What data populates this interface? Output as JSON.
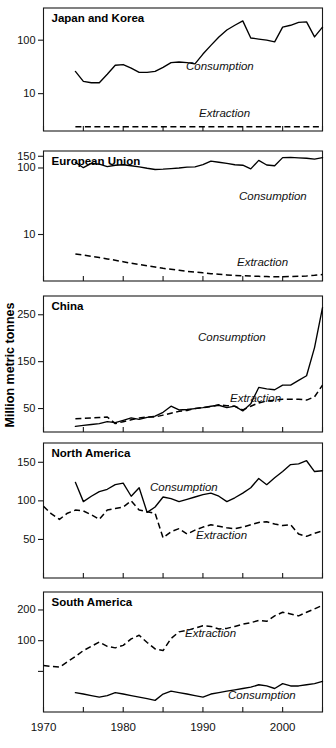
{
  "figure": {
    "ylabel": "Million metric tonnes",
    "xlabel": "",
    "xticks": [
      "1970",
      "1980",
      "1990",
      "2000"
    ],
    "xminor_step_years": 5,
    "xlim": [
      1970,
      2005
    ],
    "grid": false,
    "legend_position": "inline-annotation",
    "line_colors": {
      "consumption": "#000000",
      "extraction": "#000000"
    },
    "consumption_label": "Consumption",
    "extraction_label": "Extraction"
  },
  "chart_data": [
    {
      "type": "line",
      "title": "Japan and Korea",
      "xlabel": "",
      "ylabel": "Million metric tonnes",
      "yscale": "log",
      "ylim": [
        2,
        400
      ],
      "yticks": [
        10,
        100
      ],
      "ytick_labels": [
        "10",
        "100"
      ],
      "x": [
        1974,
        1975,
        1976,
        1977,
        1978,
        1979,
        1980,
        1981,
        1982,
        1983,
        1984,
        1985,
        1986,
        1987,
        1988,
        1989,
        1990,
        1991,
        1992,
        1993,
        1994,
        1995,
        1996,
        1997,
        1998,
        1999,
        2000,
        2001,
        2002,
        2003,
        2004,
        2005
      ],
      "series": [
        {
          "name": "Consumption",
          "style": "solid",
          "values": [
            26,
            17,
            16,
            16,
            23,
            34,
            35,
            30,
            25,
            25,
            26,
            31,
            38,
            39,
            38,
            36,
            55,
            80,
            115,
            155,
            190,
            230,
            110,
            105,
            100,
            93,
            175,
            190,
            215,
            220,
            115,
            175
          ]
        },
        {
          "name": "Extraction",
          "style": "dashed",
          "values": [
            2.4,
            2.4,
            2.4,
            2.4,
            2.4,
            2.4,
            2.4,
            2.4,
            2.4,
            2.4,
            2.4,
            2.4,
            2.4,
            2.4,
            2.4,
            2.4,
            2.4,
            2.4,
            2.4,
            2.4,
            2.4,
            2.4,
            2.4,
            2.4,
            2.4,
            2.4,
            2.4,
            2.4,
            2.4,
            2.4,
            2.4,
            2.4
          ]
        }
      ]
    },
    {
      "type": "line",
      "title": "European Union",
      "xlabel": "",
      "ylabel": "Million metric tonnes",
      "yscale": "log",
      "ylim": [
        2,
        180
      ],
      "yticks": [
        10,
        100,
        150
      ],
      "ytick_labels": [
        "10",
        "100",
        "150"
      ],
      "x": [
        1974,
        1975,
        1976,
        1977,
        1978,
        1979,
        1980,
        1981,
        1982,
        1983,
        1984,
        1985,
        1986,
        1987,
        1988,
        1989,
        1990,
        1991,
        1992,
        1993,
        1994,
        1995,
        1996,
        1997,
        1998,
        1999,
        2000,
        2001,
        2002,
        2003,
        2004,
        2005
      ],
      "series": [
        {
          "name": "Consumption",
          "style": "solid",
          "values": [
            122,
            101,
            117,
            114,
            105,
            110,
            112,
            108,
            104,
            99,
            95,
            96,
            98,
            100,
            103,
            104,
            112,
            127,
            122,
            117,
            112,
            110,
            97,
            130,
            111,
            108,
            143,
            144,
            142,
            140,
            136,
            143
          ]
        },
        {
          "name": "Extraction",
          "style": "dashed",
          "values": [
            5.1,
            4.9,
            4.7,
            4.5,
            4.3,
            4.1,
            3.9,
            3.7,
            3.55,
            3.4,
            3.25,
            3.1,
            3.0,
            2.9,
            2.8,
            2.72,
            2.65,
            2.58,
            2.52,
            2.47,
            2.43,
            2.4,
            2.37,
            2.35,
            2.33,
            2.32,
            2.32,
            2.33,
            2.35,
            2.38,
            2.43,
            2.5
          ]
        }
      ]
    },
    {
      "type": "line",
      "title": "China",
      "xlabel": "",
      "ylabel": "Million metric tonnes",
      "yscale": "linear",
      "ylim": [
        0,
        290
      ],
      "yticks": [
        50,
        150,
        250
      ],
      "ytick_labels": [
        "50",
        "150",
        "250"
      ],
      "x": [
        1974,
        1975,
        1976,
        1977,
        1978,
        1979,
        1980,
        1981,
        1982,
        1983,
        1984,
        1985,
        1986,
        1987,
        1988,
        1989,
        1990,
        1991,
        1992,
        1993,
        1994,
        1995,
        1996,
        1997,
        1998,
        1999,
        2000,
        2001,
        2002,
        2003,
        2004,
        2005
      ],
      "series": [
        {
          "name": "Consumption",
          "style": "solid",
          "values": [
            12,
            14,
            16,
            18,
            22,
            20,
            25,
            30,
            27,
            31,
            34,
            42,
            55,
            47,
            48,
            50,
            52,
            55,
            57,
            52,
            55,
            45,
            60,
            95,
            92,
            90,
            100,
            100,
            110,
            120,
            180,
            265
          ]
        },
        {
          "name": "Extraction",
          "style": "dashed",
          "values": [
            28,
            29,
            30,
            31,
            32,
            18,
            22,
            26,
            30,
            32,
            32,
            36,
            40,
            44,
            46,
            50,
            52,
            54,
            58,
            56,
            55,
            47,
            55,
            62,
            66,
            68,
            70,
            70,
            70,
            68,
            75,
            100
          ]
        }
      ]
    },
    {
      "type": "line",
      "title": "North America",
      "xlabel": "",
      "ylabel": "Million metric tonnes",
      "yscale": "linear",
      "ylim": [
        0,
        175
      ],
      "yticks": [
        50,
        100,
        150
      ],
      "ytick_labels": [
        "50",
        "100",
        "150"
      ],
      "x": [
        1970,
        1971,
        1972,
        1973,
        1974,
        1975,
        1976,
        1977,
        1978,
        1979,
        1980,
        1981,
        1982,
        1983,
        1984,
        1985,
        1986,
        1987,
        1988,
        1989,
        1990,
        1991,
        1992,
        1993,
        1994,
        1995,
        1996,
        1997,
        1998,
        1999,
        2000,
        2001,
        2002,
        2003,
        2004,
        2005
      ],
      "series": [
        {
          "name": "Consumption",
          "style": "solid",
          "values": [
            null,
            null,
            null,
            null,
            124,
            99,
            106,
            112,
            115,
            121,
            123,
            106,
            117,
            85,
            92,
            105,
            103,
            99,
            102,
            105,
            108,
            110,
            106,
            99,
            104,
            110,
            117,
            129,
            121,
            130,
            138,
            147,
            148,
            152,
            138,
            139
          ]
        },
        {
          "name": "Extraction",
          "style": "dashed",
          "values": [
            93,
            83,
            76,
            84,
            88,
            87,
            82,
            76,
            88,
            90,
            92,
            100,
            88,
            86,
            84,
            52,
            60,
            64,
            57,
            62,
            66,
            69,
            67,
            65,
            64,
            66,
            69,
            72,
            73,
            70,
            68,
            69,
            57,
            54,
            58,
            61
          ]
        }
      ]
    },
    {
      "type": "line",
      "title": "South America",
      "xlabel": "",
      "ylabel": "Million metric tonnes",
      "yscale": "log",
      "ylim": [
        20,
        300
      ],
      "yticks": [
        50,
        100,
        200
      ],
      "ytick_labels": [
        "",
        "100",
        "200"
      ],
      "x": [
        1970,
        1971,
        1972,
        1973,
        1974,
        1975,
        1976,
        1977,
        1978,
        1979,
        1980,
        1981,
        1982,
        1983,
        1984,
        1985,
        1986,
        1987,
        1988,
        1989,
        1990,
        1991,
        1992,
        1993,
        1994,
        1995,
        1996,
        1997,
        1998,
        1999,
        2000,
        2001,
        2002,
        2003,
        2004,
        2005
      ],
      "series": [
        {
          "name": "Extraction",
          "style": "dashed",
          "values": [
            57,
            56,
            55,
            62,
            70,
            80,
            88,
            97,
            88,
            85,
            90,
            104,
            113,
            96,
            83,
            80,
            105,
            122,
            126,
            133,
            140,
            138,
            130,
            132,
            138,
            145,
            150,
            158,
            155,
            175,
            190,
            183,
            175,
            190,
            205,
            222
          ]
        },
        {
          "name": "Consumption",
          "style": "solid",
          "values": [
            null,
            null,
            null,
            null,
            31,
            30,
            29,
            28,
            29,
            31,
            30,
            29,
            28,
            27,
            26,
            30,
            32,
            31,
            30,
            29,
            28,
            30,
            31,
            32,
            33,
            34,
            35,
            37,
            36,
            34,
            38,
            36,
            36,
            37,
            38,
            40
          ]
        }
      ]
    }
  ]
}
